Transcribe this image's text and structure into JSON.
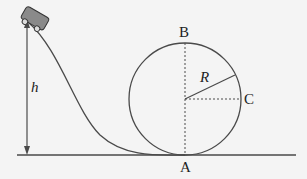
{
  "diagram": {
    "labels": {
      "height": "h",
      "radius": "R",
      "top_point": "B",
      "bottom_point": "A",
      "side_point": "C"
    },
    "colors": {
      "line": "#4a4a4a",
      "cart": "#8a8a8a",
      "background": "#f4f4f4"
    }
  }
}
